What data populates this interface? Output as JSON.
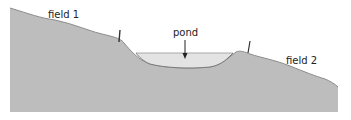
{
  "diagram": {
    "labels": {
      "field1": "field 1",
      "field2": "field 2",
      "pond": "pond"
    },
    "colors": {
      "ground": "#bdbdbd",
      "ground_edge": "#8c8c8c",
      "water": "#e3e3e3",
      "water_surface": "#a8a8a8",
      "post": "#333333",
      "arrow": "#222222",
      "background": "#ffffff"
    }
  }
}
